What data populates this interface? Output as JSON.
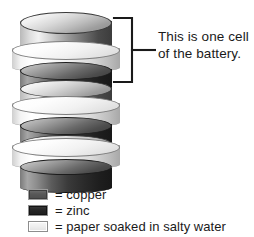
{
  "figure": {
    "annotation": {
      "line1": "This is one cell",
      "line2": "of the battery."
    },
    "bracket": {
      "name": "cell-bracket",
      "color": "#1a1a1a"
    }
  },
  "stack": {
    "description": "Stack of alternating copper, paper and zinc discs forming a voltaic pile",
    "layers": [
      {
        "material": "copper",
        "label": "copper-disc-1",
        "color": "#8a8a8a"
      },
      {
        "material": "paper",
        "label": "paper-disc-1",
        "color": "#f2f2f2"
      },
      {
        "material": "zinc",
        "label": "zinc-disc-1",
        "color": "#2a2a2a"
      },
      {
        "material": "copper",
        "label": "copper-disc-2",
        "color": "#8a8a8a"
      },
      {
        "material": "paper",
        "label": "paper-disc-2",
        "color": "#f2f2f2"
      },
      {
        "material": "zinc",
        "label": "zinc-disc-2",
        "color": "#2a2a2a"
      },
      {
        "material": "copper",
        "label": "copper-disc-3",
        "color": "#8a8a8a"
      },
      {
        "material": "paper",
        "label": "paper-disc-3",
        "color": "#f2f2f2"
      },
      {
        "material": "zinc",
        "label": "zinc-disc-3",
        "color": "#2a2a2a"
      }
    ]
  },
  "legend": {
    "items": [
      {
        "swatch": "copper",
        "equals": "=",
        "label": "= copper",
        "color": "#585858"
      },
      {
        "swatch": "zinc",
        "equals": "=",
        "label": "= zinc",
        "color": "#262626"
      },
      {
        "swatch": "paper",
        "equals": "=",
        "label": "= paper soaked in salty water",
        "color": "#eeeeee"
      }
    ]
  }
}
